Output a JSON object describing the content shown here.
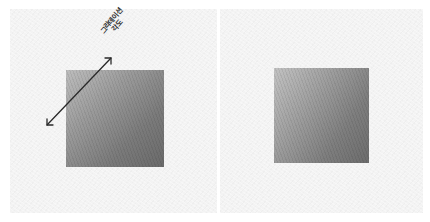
{
  "panels": [
    {
      "id": "left",
      "annotation": {
        "line1": "그라데이션",
        "line2": "각도",
        "arrow": "double-headed-arrow"
      },
      "gradient": {
        "start_color": "#bdbdbd",
        "end_color": "#6a6a6a",
        "direction": "top-left to bottom-right"
      }
    },
    {
      "id": "right",
      "gradient": {
        "start_color": "#c2c2c2",
        "end_color": "#6c6c6c",
        "direction": "top-left to bottom-right"
      }
    }
  ],
  "colors": {
    "paper": "#f3f3f3",
    "background": "#ffffff",
    "arrow": "#2a2a2a"
  }
}
